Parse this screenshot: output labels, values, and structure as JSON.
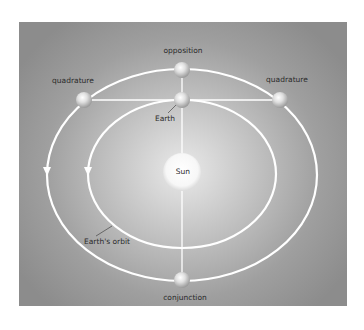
{
  "diagram": {
    "labels": {
      "opposition": "opposition",
      "quadrature_left": "quadrature",
      "quadrature_right": "quadrature",
      "earth": "Earth",
      "sun": "Sun",
      "earths_orbit": "Earth's orbit",
      "conjunction": "conjunction"
    },
    "colors": {
      "panel_edge": "#8c8c8c",
      "panel_center": "#e9e9e9",
      "orbit_line": "#ffffff",
      "text": "#2a2a2a"
    }
  }
}
